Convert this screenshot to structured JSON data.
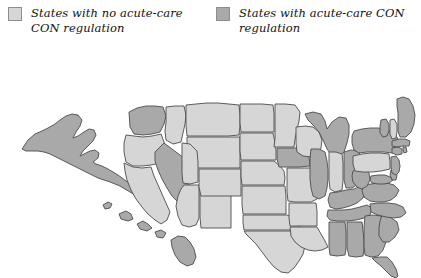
{
  "legend": {
    "entries": [
      {
        "swatch": "light-gray-swatch",
        "color": "#d6d6d6",
        "label": "States with no acute-care CON regulation"
      },
      {
        "swatch": "dark-gray-swatch",
        "color": "#a9a9a9",
        "label": "States with acute-care CON regulation"
      }
    ]
  },
  "map": {
    "title": "United States map of acute-care CON regulation",
    "colors": {
      "no_con_fill": "#d6d6d6",
      "has_con_fill": "#a9a9a9",
      "border": "#4c4c4c",
      "background": "#ffffff"
    },
    "categories": {
      "no_con": "States with no acute-care CON regulation",
      "has_con": "States with acute-care CON regulation"
    },
    "states": [
      {
        "code": "AK",
        "name": "Alaska",
        "status": "has_con"
      },
      {
        "code": "HI",
        "name": "Hawaii",
        "status": "has_con"
      },
      {
        "code": "WA",
        "name": "Washington",
        "status": "has_con"
      },
      {
        "code": "OR",
        "name": "Oregon",
        "status": "no_con"
      },
      {
        "code": "CA",
        "name": "California",
        "status": "no_con"
      },
      {
        "code": "NV",
        "name": "Nevada",
        "status": "has_con"
      },
      {
        "code": "ID",
        "name": "Idaho",
        "status": "no_con"
      },
      {
        "code": "MT",
        "name": "Montana",
        "status": "no_con"
      },
      {
        "code": "WY",
        "name": "Wyoming",
        "status": "no_con"
      },
      {
        "code": "UT",
        "name": "Utah",
        "status": "no_con"
      },
      {
        "code": "AZ",
        "name": "Arizona",
        "status": "no_con"
      },
      {
        "code": "NM",
        "name": "New Mexico",
        "status": "no_con"
      },
      {
        "code": "CO",
        "name": "Colorado",
        "status": "no_con"
      },
      {
        "code": "ND",
        "name": "North Dakota",
        "status": "no_con"
      },
      {
        "code": "SD",
        "name": "South Dakota",
        "status": "no_con"
      },
      {
        "code": "NE",
        "name": "Nebraska",
        "status": "no_con"
      },
      {
        "code": "KS",
        "name": "Kansas",
        "status": "no_con"
      },
      {
        "code": "OK",
        "name": "Oklahoma",
        "status": "no_con"
      },
      {
        "code": "TX",
        "name": "Texas",
        "status": "no_con"
      },
      {
        "code": "MN",
        "name": "Minnesota",
        "status": "no_con"
      },
      {
        "code": "IA",
        "name": "Iowa",
        "status": "has_con"
      },
      {
        "code": "MO",
        "name": "Missouri",
        "status": "no_con"
      },
      {
        "code": "AR",
        "name": "Arkansas",
        "status": "no_con"
      },
      {
        "code": "LA",
        "name": "Louisiana",
        "status": "no_con"
      },
      {
        "code": "WI",
        "name": "Wisconsin",
        "status": "no_con"
      },
      {
        "code": "IL",
        "name": "Illinois",
        "status": "has_con"
      },
      {
        "code": "MI",
        "name": "Michigan",
        "status": "has_con"
      },
      {
        "code": "IN",
        "name": "Indiana",
        "status": "no_con"
      },
      {
        "code": "OH",
        "name": "Ohio",
        "status": "has_con"
      },
      {
        "code": "KY",
        "name": "Kentucky",
        "status": "has_con"
      },
      {
        "code": "TN",
        "name": "Tennessee",
        "status": "has_con"
      },
      {
        "code": "MS",
        "name": "Mississippi",
        "status": "has_con"
      },
      {
        "code": "AL",
        "name": "Alabama",
        "status": "has_con"
      },
      {
        "code": "GA",
        "name": "Georgia",
        "status": "has_con"
      },
      {
        "code": "FL",
        "name": "Florida",
        "status": "has_con"
      },
      {
        "code": "SC",
        "name": "South Carolina",
        "status": "has_con"
      },
      {
        "code": "NC",
        "name": "North Carolina",
        "status": "has_con"
      },
      {
        "code": "VA",
        "name": "Virginia",
        "status": "has_con"
      },
      {
        "code": "WV",
        "name": "West Virginia",
        "status": "has_con"
      },
      {
        "code": "MD",
        "name": "Maryland",
        "status": "has_con"
      },
      {
        "code": "DE",
        "name": "Delaware",
        "status": "has_con"
      },
      {
        "code": "PA",
        "name": "Pennsylvania",
        "status": "no_con"
      },
      {
        "code": "NJ",
        "name": "New Jersey",
        "status": "has_con"
      },
      {
        "code": "NY",
        "name": "New York",
        "status": "has_con"
      },
      {
        "code": "CT",
        "name": "Connecticut",
        "status": "has_con"
      },
      {
        "code": "RI",
        "name": "Rhode Island",
        "status": "has_con"
      },
      {
        "code": "MA",
        "name": "Massachusetts",
        "status": "has_con"
      },
      {
        "code": "VT",
        "name": "Vermont",
        "status": "has_con"
      },
      {
        "code": "NH",
        "name": "New Hampshire",
        "status": "no_con"
      },
      {
        "code": "ME",
        "name": "Maine",
        "status": "has_con"
      }
    ]
  }
}
